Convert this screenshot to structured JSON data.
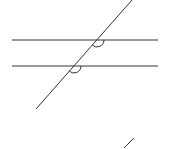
{
  "diagram": {
    "type": "parallel-lines-cut-by-transversal",
    "stroke_color": "#333333",
    "background": "#ffffff",
    "parallel_lines": [
      {
        "x1": 12,
        "y1": 40,
        "x2": 158,
        "y2": 40
      },
      {
        "x1": 12,
        "y1": 66,
        "x2": 158,
        "y2": 66
      }
    ],
    "transversal": {
      "x1": 132,
      "y1": 0,
      "x2": 36,
      "y2": 109
    },
    "angle_marks": [
      {
        "cx": 97,
        "cy": 40,
        "position": "below-right"
      },
      {
        "cx": 74,
        "cy": 66,
        "position": "below-right"
      }
    ],
    "fragment_stroke": {
      "x1": 124,
      "y1": 148,
      "x2": 134,
      "y2": 138
    }
  }
}
